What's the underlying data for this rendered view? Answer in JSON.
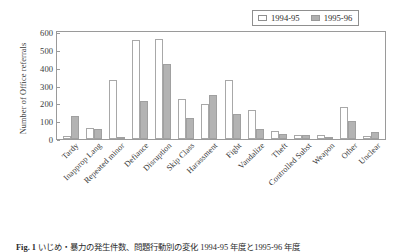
{
  "chart_data": {
    "type": "bar",
    "title": "",
    "xlabel": "",
    "ylabel": "Number of Office referrals",
    "ylim": [
      0,
      600
    ],
    "yticks": [
      600,
      500,
      400,
      300,
      200,
      100,
      0
    ],
    "grid": false,
    "legend_position": "top-right",
    "categories": [
      "Tardy",
      "Inapprop Lang",
      "Repeated minor",
      "Defiance",
      "Disruption",
      "Skip Class",
      "Harassment",
      "Fight",
      "Vandalize",
      "Theft",
      "Controlled Subst",
      "Weapon",
      "Other",
      "Unclear"
    ],
    "series": [
      {
        "name": "1994-95",
        "color": "#ffffff",
        "values": [
          15,
          62,
          330,
          558,
          562,
          222,
          195,
          330,
          160,
          45,
          25,
          25,
          180,
          18
        ]
      },
      {
        "name": "1995-96",
        "color": "#b3b3b3",
        "values": [
          130,
          57,
          10,
          215,
          420,
          120,
          245,
          140,
          55,
          30,
          22,
          5,
          100,
          42
        ]
      }
    ]
  },
  "legend": {
    "items": [
      {
        "label": "1994-95",
        "swatch": "open-square-swatch"
      },
      {
        "label": "1995-96",
        "swatch": "filled-square-swatch"
      }
    ]
  },
  "caption": {
    "figure_number": "Fig. 1",
    "text": "いじめ・暴力の発生件数、問題行動別の変化  1994-95 年度と1995-96 年度"
  }
}
